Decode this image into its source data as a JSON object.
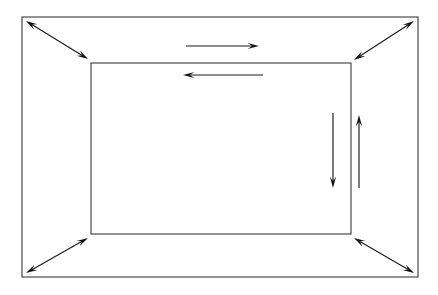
{
  "figure": {
    "background_color": "#ffffff",
    "line_color": "#3a3a3a",
    "arrow_color": "#111111",
    "canvas": {
      "width": 438,
      "height": 295
    }
  },
  "shapes": {
    "outer_rectangle": {
      "name": "outer-rectangle",
      "x": 22,
      "y": 17,
      "width": 396,
      "height": 260,
      "label": "Outer rectangle"
    },
    "inner_rectangle": {
      "name": "inner-rectangle",
      "x": 91,
      "y": 63,
      "width": 260,
      "height": 171,
      "label": "Inner rectangle"
    }
  },
  "arrows": {
    "corner_arrows": [
      {
        "name": "corner-arrow-top-left",
        "label": "Top-left diagonal double arrow",
        "type": "double",
        "x1": 26,
        "y1": 21,
        "x2": 88,
        "y2": 59
      },
      {
        "name": "corner-arrow-top-right",
        "label": "Top-right diagonal double arrow",
        "type": "double",
        "x1": 414,
        "y1": 21,
        "x2": 354,
        "y2": 60
      },
      {
        "name": "corner-arrow-bottom-left",
        "label": "Bottom-left diagonal double arrow",
        "type": "double",
        "x1": 26,
        "y1": 273,
        "x2": 88,
        "y2": 238
      },
      {
        "name": "corner-arrow-bottom-right",
        "label": "Bottom-right diagonal double arrow",
        "type": "double",
        "x1": 414,
        "y1": 273,
        "x2": 354,
        "y2": 238
      }
    ],
    "flow_arrows": [
      {
        "name": "flow-arrow-top-right",
        "label": "Top horizontal arrow pointing right",
        "type": "single",
        "direction": "right",
        "x1": 186,
        "y1": 46,
        "x2": 259,
        "y2": 46
      },
      {
        "name": "flow-arrow-top-left",
        "label": "Second horizontal arrow pointing left",
        "type": "single",
        "direction": "left",
        "x1": 263,
        "y1": 75,
        "x2": 183,
        "y2": 75
      },
      {
        "name": "flow-arrow-right-down",
        "label": "Inner vertical arrow pointing down",
        "type": "single",
        "direction": "down",
        "x1": 333,
        "y1": 113,
        "x2": 333,
        "y2": 188
      },
      {
        "name": "flow-arrow-right-up",
        "label": "Outer vertical arrow pointing up",
        "type": "single",
        "direction": "up",
        "x1": 359,
        "y1": 188,
        "x2": 359,
        "y2": 115
      }
    ]
  }
}
